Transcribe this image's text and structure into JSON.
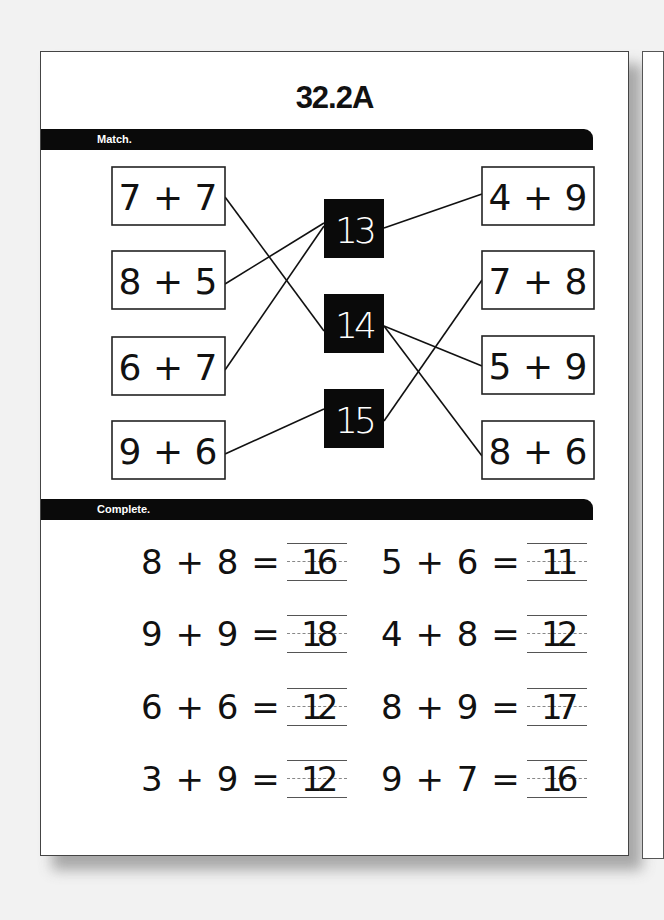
{
  "worksheet": {
    "title": "32.2A",
    "sections": [
      {
        "label": "Match."
      },
      {
        "label": "Complete."
      }
    ]
  },
  "match": {
    "left": [
      "7 + 7",
      "8 + 5",
      "6 + 7",
      "9 + 6"
    ],
    "answers": [
      "13",
      "14",
      "15"
    ],
    "right": [
      "4 + 9",
      "7 + 8",
      "5 + 9",
      "8 + 6"
    ],
    "connections": [
      {
        "from": "7 + 7",
        "to": "14"
      },
      {
        "from": "8 + 5",
        "to": "13"
      },
      {
        "from": "6 + 7",
        "to": "13"
      },
      {
        "from": "9 + 6",
        "to": "15"
      },
      {
        "from": "13",
        "to": "4 + 9"
      },
      {
        "from": "14",
        "to": "5 + 9"
      },
      {
        "from": "14",
        "to": "8 + 6"
      },
      {
        "from": "15",
        "to": "7 + 8"
      }
    ]
  },
  "complete": {
    "rows": [
      [
        {
          "expr": "8 + 8 =",
          "answer": "16"
        },
        {
          "expr": "5 + 6 =",
          "answer": "11"
        }
      ],
      [
        {
          "expr": "9 + 9 =",
          "answer": "18"
        },
        {
          "expr": "4 + 8 =",
          "answer": "12"
        }
      ],
      [
        {
          "expr": "6 + 6 =",
          "answer": "12"
        },
        {
          "expr": "8 + 9 =",
          "answer": "17"
        }
      ],
      [
        {
          "expr": "3 + 9 =",
          "answer": "12"
        },
        {
          "expr": "9 + 7 =",
          "answer": "16"
        }
      ]
    ]
  }
}
